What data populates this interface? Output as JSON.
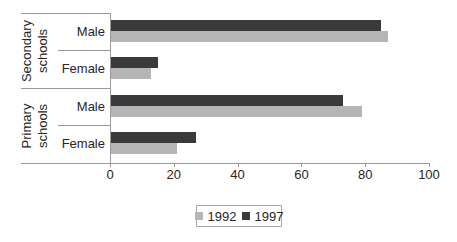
{
  "chart_data": {
    "type": "bar",
    "orientation": "horizontal",
    "title": "",
    "xlabel": "",
    "ylabel": "",
    "xlim": [
      0,
      100
    ],
    "x_ticks": [
      0,
      20,
      40,
      60,
      80,
      100
    ],
    "grid": false,
    "legend_position": "bottom",
    "group_labels": [
      "Secondary schools",
      "Primary schools"
    ],
    "categories": [
      "Male",
      "Female",
      "Male",
      "Female"
    ],
    "rows": [
      {
        "group": "Secondary schools",
        "label": "Male",
        "values": {
          "1992": 87,
          "1997": 85
        }
      },
      {
        "group": "Secondary schools",
        "label": "Female",
        "values": {
          "1992": 13,
          "1997": 15
        }
      },
      {
        "group": "Primary schools",
        "label": "Male",
        "values": {
          "1992": 79,
          "1997": 73
        }
      },
      {
        "group": "Primary schools",
        "label": "Female",
        "values": {
          "1992": 21,
          "1997": 27
        }
      }
    ],
    "series": [
      {
        "name": "1992",
        "color": "#b5b5b5",
        "values": [
          87,
          13,
          79,
          21
        ]
      },
      {
        "name": "1997",
        "color": "#3a3a3a",
        "values": [
          85,
          15,
          73,
          27
        ]
      }
    ],
    "bar_display_order": [
      "1997",
      "1992"
    ],
    "colors": {
      "background": "#ffffff",
      "axis_line": "#9a9a9a",
      "text": "#262626",
      "legend_border": "#ababab"
    }
  }
}
